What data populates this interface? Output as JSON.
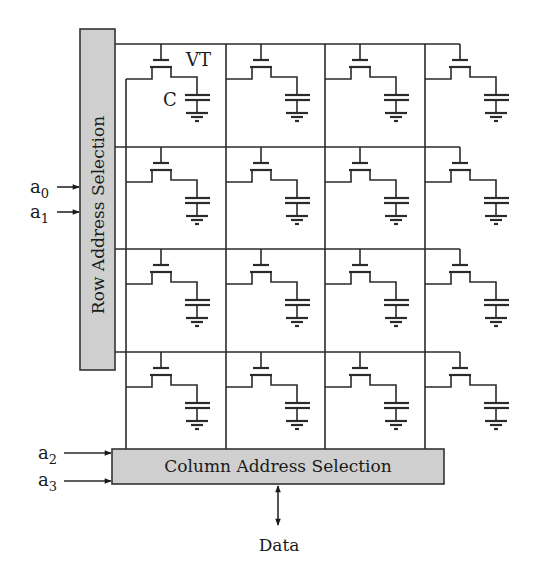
{
  "diagram": {
    "colors": {
      "wire": "#2a2a2a",
      "box_fill": "#cfcfcf",
      "box_stroke": "#333333",
      "background": "#ffffff"
    },
    "row_decoder": {
      "label": "Row Address Selection",
      "inputs": [
        {
          "name": "a",
          "sub": "0"
        },
        {
          "name": "a",
          "sub": "1"
        }
      ]
    },
    "column_decoder": {
      "label": "Column Address Selection",
      "inputs": [
        {
          "name": "a",
          "sub": "2"
        },
        {
          "name": "a",
          "sub": "3"
        }
      ]
    },
    "data_port": {
      "label": "Data",
      "direction": "bidirectional"
    },
    "cell_labels": {
      "transistor": "VT",
      "capacitor": "C"
    },
    "array": {
      "rows": 4,
      "columns": 4
    },
    "nodes": [
      {
        "id": "row-decoder",
        "label": "Row Address Selection"
      },
      {
        "id": "column-decoder",
        "label": "Column Address Selection"
      },
      {
        "id": "memory-cells",
        "label": "4x4 array of 1T1C cells (VT + C)"
      },
      {
        "id": "data",
        "label": "Data"
      }
    ],
    "edges": [
      {
        "from": "a0",
        "to": "row-decoder"
      },
      {
        "from": "a1",
        "to": "row-decoder"
      },
      {
        "from": "a2",
        "to": "column-decoder"
      },
      {
        "from": "a3",
        "to": "column-decoder"
      },
      {
        "from": "row-decoder",
        "to": "memory-cells",
        "label": "word lines"
      },
      {
        "from": "memory-cells",
        "to": "column-decoder",
        "label": "bit lines"
      },
      {
        "from": "column-decoder",
        "to": "data",
        "bidirectional": true
      }
    ]
  }
}
